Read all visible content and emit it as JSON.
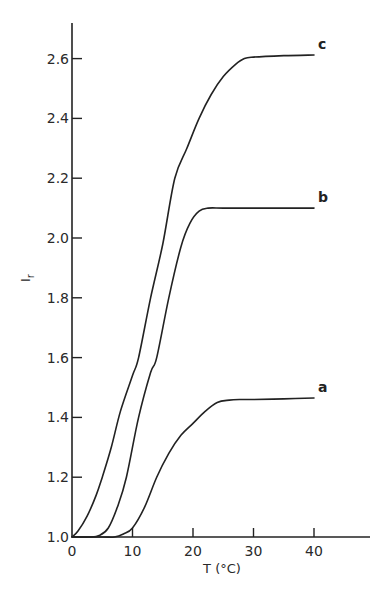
{
  "chart_data": {
    "type": "line",
    "title": "",
    "xlabel": "T (°C)",
    "ylabel": "I_r",
    "xlim": [
      0,
      48
    ],
    "ylim": [
      1.0,
      2.72
    ],
    "grid": false,
    "legend": "inline labels at curve ends",
    "x_ticks": [
      0,
      10,
      20,
      30,
      40
    ],
    "x_tick_labels": [
      "0",
      "10",
      "20",
      "30",
      "40"
    ],
    "y_ticks": [
      1.0,
      1.2,
      1.4,
      1.6,
      1.8,
      2.0,
      2.2,
      2.4,
      2.6
    ],
    "y_tick_labels": [
      "1.0",
      "1.2",
      "1.4",
      "1.6",
      "1.8",
      "2.0",
      "2.2",
      "2.4",
      "2.6"
    ],
    "series": [
      {
        "name": "a",
        "x": [
          0,
          5,
          7,
          8.5,
          10,
          12,
          14,
          16,
          18,
          20,
          22,
          24,
          26,
          28,
          30,
          35,
          40
        ],
        "y": [
          1.0,
          1.0,
          1.0,
          1.01,
          1.03,
          1.1,
          1.2,
          1.28,
          1.34,
          1.38,
          1.42,
          1.45,
          1.458,
          1.46,
          1.46,
          1.462,
          1.465
        ]
      },
      {
        "name": "b",
        "x": [
          0,
          3,
          4.5,
          6,
          7.5,
          9,
          11,
          13,
          14,
          16,
          18,
          19.5,
          21,
          22.5,
          25,
          30,
          35,
          40
        ],
        "y": [
          1.0,
          1.0,
          1.005,
          1.03,
          1.1,
          1.2,
          1.4,
          1.55,
          1.6,
          1.8,
          1.97,
          2.05,
          2.09,
          2.1,
          2.1,
          2.1,
          2.1,
          2.1
        ]
      },
      {
        "name": "c",
        "x": [
          0,
          1,
          2.5,
          4,
          5,
          6.5,
          8,
          10,
          11,
          13,
          15,
          17,
          19,
          21,
          23,
          25,
          27,
          28.5,
          30,
          35,
          40
        ],
        "y": [
          1.0,
          1.02,
          1.07,
          1.14,
          1.2,
          1.3,
          1.42,
          1.54,
          1.6,
          1.8,
          1.98,
          2.2,
          2.3,
          2.4,
          2.48,
          2.54,
          2.58,
          2.6,
          2.605,
          2.61,
          2.612
        ]
      }
    ]
  }
}
